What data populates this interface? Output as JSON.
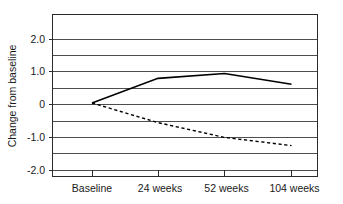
{
  "chart_data": {
    "type": "line",
    "title": "",
    "subtitle": "",
    "xlabel": "",
    "ylabel": "Change from baseline",
    "categories": [
      "Baseline",
      "24 weeks",
      "52 weeks",
      "104 weeks"
    ],
    "x": [
      0,
      24,
      52,
      104
    ],
    "xlim": [
      -8,
      118
    ],
    "ylim": [
      -2.0,
      2.5
    ],
    "ytick_labels": [
      "2.0",
      "1.0",
      "0",
      "-1.0",
      "-2.0"
    ],
    "ytick_values": [
      2.0,
      1.0,
      0,
      -1.0,
      -2.0
    ],
    "minor_gridlines": true,
    "minor_gridline_values": [
      2.0,
      1.5,
      1.0,
      0.5,
      0,
      -0.5,
      -1.0,
      -1.5,
      -2.0
    ],
    "grid": true,
    "legend": "none",
    "legend_position": "none",
    "series": [
      {
        "name": "solid-line",
        "style": "solid",
        "color": "#000000",
        "values": [
          0.05,
          0.8,
          0.95,
          0.62
        ]
      },
      {
        "name": "dashed-line",
        "style": "dashed",
        "color": "#000000",
        "values": [
          0.05,
          -0.55,
          -1.0,
          -1.25
        ]
      }
    ],
    "annotations": []
  },
  "axis": {
    "y_title": "Change from baseline",
    "y_ticks": [
      {
        "label": "2.0",
        "value": 2.0
      },
      {
        "label": "1.0",
        "value": 1.0
      },
      {
        "label": "0",
        "value": 0
      },
      {
        "label": "-1.0",
        "value": -1.0
      },
      {
        "label": "-2.0",
        "value": -2.0
      }
    ],
    "x_ticks": [
      {
        "label": "Baseline",
        "value": 0
      },
      {
        "label": "24 weeks",
        "value": 24
      },
      {
        "label": "52 weeks",
        "value": 52
      },
      {
        "label": "104 weeks",
        "value": 104
      }
    ]
  },
  "colors": {
    "background": "#ffffff",
    "grid": "#3a3a3a",
    "frame": "#2a2a2a",
    "series": "#000000",
    "text": "#1a1a1a"
  }
}
